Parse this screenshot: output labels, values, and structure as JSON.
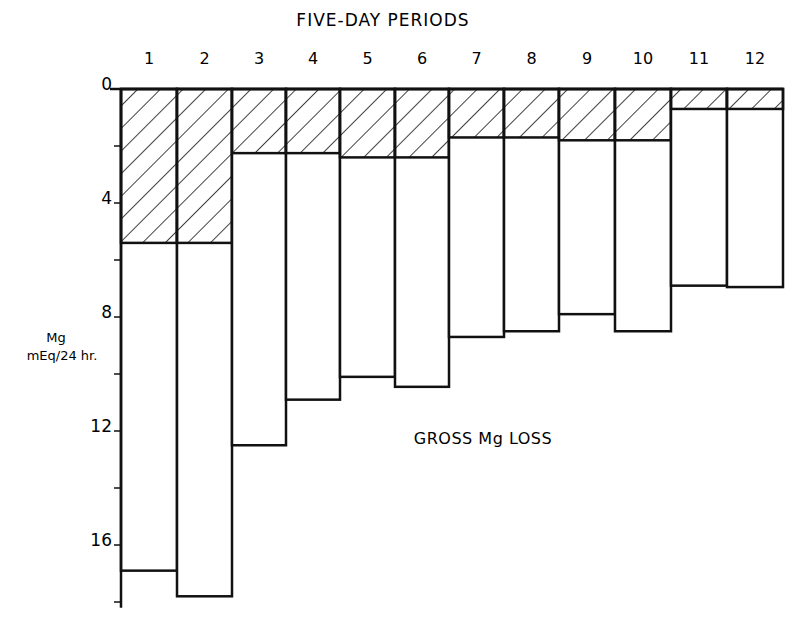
{
  "chart_data": {
    "type": "bar",
    "title": "FIVE-DAY PERIODS",
    "xlabel": "FIVE-DAY PERIODS",
    "ylabel": "Mg mEq/24 hr.",
    "ylabel_lines": [
      "Mg",
      "mEq/24 hr."
    ],
    "y_inverted": true,
    "ylim": [
      0,
      18
    ],
    "y_ticks": [
      0,
      4,
      8,
      12,
      16
    ],
    "y_minor_ticks": [
      2,
      6,
      10,
      14,
      18
    ],
    "categories": [
      "1",
      "2",
      "3",
      "4",
      "5",
      "6",
      "7",
      "8",
      "9",
      "10",
      "11",
      "12"
    ],
    "series": [
      {
        "name": "Hatched portion (net Mg loss)",
        "pattern": "diagonal-hatch",
        "values": [
          5.4,
          5.4,
          2.25,
          2.25,
          2.4,
          2.4,
          1.7,
          1.7,
          1.8,
          1.8,
          0.7,
          0.7
        ]
      },
      {
        "name": "GROSS Mg LOSS",
        "pattern": "open",
        "values": [
          16.9,
          17.8,
          12.5,
          10.9,
          10.1,
          10.45,
          8.7,
          8.5,
          7.9,
          8.5,
          6.9,
          6.95
        ]
      }
    ],
    "annotations": [
      "GROSS Mg LOSS"
    ],
    "grid": false,
    "legend": null
  },
  "colors": {
    "ink": "#111111",
    "background": "#ffffff"
  }
}
